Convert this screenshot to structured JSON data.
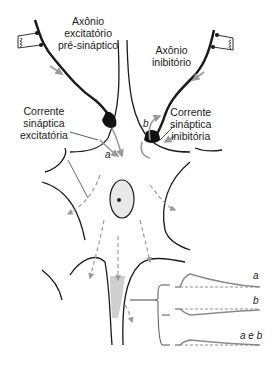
{
  "labels": {
    "excitatory_axon": [
      "Axônio",
      "excitatório",
      "pré-sináptico"
    ],
    "inhibitory_axon": [
      "Axônio",
      "inibitório"
    ],
    "excitatory_current": [
      "Corrente",
      "sináptica",
      "excitatória"
    ],
    "inhibitory_current": [
      "Corrente",
      "sináptica",
      "inibitória"
    ]
  },
  "markers": {
    "a": "a",
    "b": "b"
  },
  "traces": [
    {
      "label": "a",
      "type": "depolarizing"
    },
    {
      "label": "b",
      "type": "hyperpolarizing"
    },
    {
      "label": "a e b",
      "type": "summed"
    }
  ],
  "colors": {
    "line": "#1a1a1a",
    "arrow": "#9a9a9a",
    "terminal": "#111111"
  }
}
